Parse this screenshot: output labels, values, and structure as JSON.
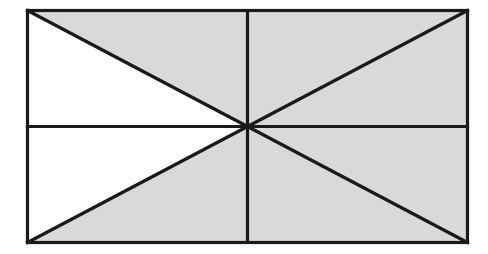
{
  "figure": {
    "name": "eight-triangle-rectangle-diagram",
    "canvas": {
      "width": 488,
      "height": 254
    },
    "colors": {
      "background": "#ffffff",
      "shaded_fill": "#d9d9d9",
      "unshaded_fill": "#ffffff",
      "stroke": "#1a1a1a"
    },
    "stroke_width": 3.2,
    "rect": {
      "x": 27.5,
      "y": 10.5,
      "width": 440,
      "height": 232
    },
    "points": {
      "top_left": {
        "x": 27.5,
        "y": 10.5
      },
      "top_mid": {
        "x": 247.5,
        "y": 10.5
      },
      "top_right": {
        "x": 467.5,
        "y": 10.5
      },
      "mid_left": {
        "x": 27.5,
        "y": 126.5
      },
      "center": {
        "x": 247.5,
        "y": 126.5
      },
      "mid_right": {
        "x": 467.5,
        "y": 126.5
      },
      "bottom_left": {
        "x": 27.5,
        "y": 242.5
      },
      "bottom_mid": {
        "x": 247.5,
        "y": 242.5
      },
      "bottom_right": {
        "x": 467.5,
        "y": 242.5
      }
    },
    "regions": [
      {
        "id": "upper-left-upper-triangle",
        "vertices": "27.5,10.5 247.5,10.5 247.5,126.5",
        "shaded": true
      },
      {
        "id": "upper-left-lower-triangle",
        "vertices": "27.5,10.5 247.5,126.5 27.5,126.5",
        "shaded": false
      },
      {
        "id": "upper-right-upper-triangle",
        "vertices": "247.5,10.5 467.5,10.5 247.5,126.5",
        "shaded": true
      },
      {
        "id": "upper-right-lower-triangle",
        "vertices": "467.5,10.5 467.5,126.5 247.5,126.5",
        "shaded": true
      },
      {
        "id": "lower-left-upper-triangle",
        "vertices": "27.5,126.5 247.5,126.5 27.5,242.5",
        "shaded": false
      },
      {
        "id": "lower-left-lower-triangle",
        "vertices": "247.5,126.5 247.5,242.5 27.5,242.5",
        "shaded": true
      },
      {
        "id": "lower-right-upper-triangle",
        "vertices": "247.5,126.5 467.5,126.5 467.5,242.5",
        "shaded": true
      },
      {
        "id": "lower-right-lower-triangle",
        "vertices": "247.5,126.5 467.5,242.5 247.5,242.5",
        "shaded": true
      }
    ],
    "lines": [
      {
        "id": "outer-border",
        "x1": 27.5,
        "y1": 10.5,
        "x2": 467.5,
        "y2": 10.5
      },
      {
        "id": "horizontal-midline",
        "x1": 27.5,
        "y1": 126.5,
        "x2": 467.5,
        "y2": 126.5
      },
      {
        "id": "vertical-midline",
        "x1": 247.5,
        "y1": 10.5,
        "x2": 247.5,
        "y2": 242.5
      },
      {
        "id": "diagonal-top-left",
        "x1": 27.5,
        "y1": 10.5,
        "x2": 247.5,
        "y2": 126.5
      },
      {
        "id": "diagonal-top-right",
        "x1": 467.5,
        "y1": 10.5,
        "x2": 247.5,
        "y2": 126.5
      },
      {
        "id": "diagonal-bottom-left",
        "x1": 27.5,
        "y1": 242.5,
        "x2": 247.5,
        "y2": 126.5
      },
      {
        "id": "diagonal-bottom-right",
        "x1": 467.5,
        "y1": 242.5,
        "x2": 247.5,
        "y2": 126.5
      }
    ]
  }
}
